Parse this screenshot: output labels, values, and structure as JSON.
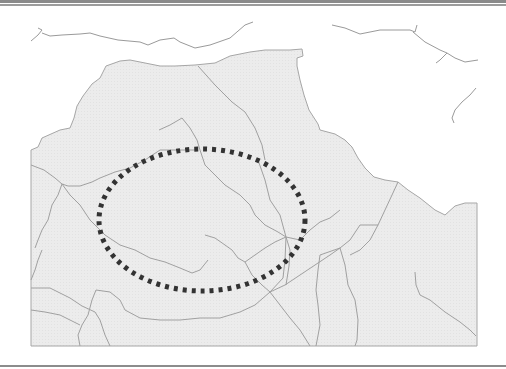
{
  "figure": {
    "type": "map",
    "colors": {
      "land": "#ececec",
      "water_background": "#ffffff",
      "lines": "#9a9a9a",
      "highlight_ellipse": "#333333",
      "rule": "#8a8a8a"
    },
    "highlight": {
      "shape": "dotted-ellipse",
      "center_x": 202,
      "center_y": 220,
      "radius_x": 103,
      "radius_y": 71
    }
  }
}
